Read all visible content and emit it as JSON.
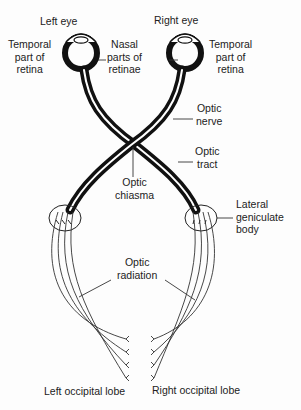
{
  "diagram": {
    "colors": {
      "stroke": "#111111",
      "thin": "#333333",
      "background": "#fdfdfd",
      "text": "#222222"
    },
    "labels": {
      "left_eye": "Left eye",
      "right_eye": "Right eye",
      "temporal_left": "Temporal\npart of\nretina",
      "nasal": "Nasal\nparts of\nretinae",
      "temporal_right": "Temporal\npart of\nretina",
      "optic_nerve": "Optic\nnerve",
      "optic_tract": "Optic\ntract",
      "optic_chiasma": "Optic\nchiasma",
      "lateral_geniculate_body": "Lateral\ngeniculate\nbody",
      "optic_radiation": "Optic\nradiation",
      "left_occipital_lobe": "Left occipital lobe",
      "right_occipital_lobe": "Right occipital lobe"
    }
  }
}
